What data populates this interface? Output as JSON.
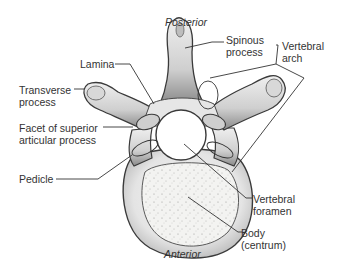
{
  "diagram": {
    "orientation": {
      "top": "Posterior",
      "bottom": "Anterior"
    },
    "labels": {
      "spinous_process": {
        "line1": "Spinous",
        "line2": "process"
      },
      "vertebral_arch": {
        "line1": "Vertebral",
        "line2": "arch"
      },
      "lamina": {
        "line1": "Lamina"
      },
      "transverse_process": {
        "line1": "Transverse",
        "line2": "process"
      },
      "facet": {
        "line1": "Facet of superior",
        "line2": "articular process"
      },
      "pedicle": {
        "line1": "Pedicle"
      },
      "vertebral_foramen": {
        "line1": "Vertebral",
        "line2": "foramen"
      },
      "body": {
        "line1": "Body",
        "line2": "(centrum)"
      }
    },
    "colors": {
      "line": "#333333",
      "bone_light": "#f2f2f2",
      "bone_mid": "#c9c9c9",
      "bone_dark": "#6e6e6e",
      "background": "#ffffff"
    }
  }
}
